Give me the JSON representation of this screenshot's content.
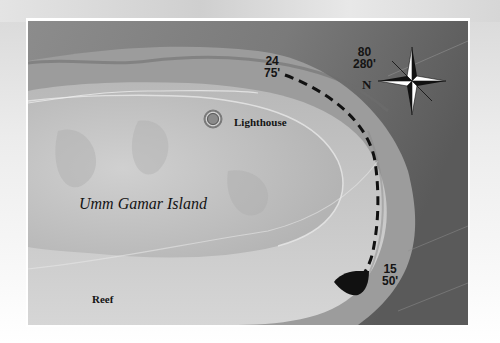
{
  "map": {
    "title": "Umm Gamar Island dive site map",
    "colors": {
      "deep_water": "#606060",
      "shallow_water": "#9a9a9a",
      "reef_flat": "#cfcfcf",
      "island": "#c2c2c2",
      "route_line": "#111111",
      "boat": "#111111",
      "frame": "#ffffff"
    },
    "labels": {
      "island": "Umm Gamar Island",
      "lighthouse": "Lighthouse",
      "reef": "Reef",
      "north": "N"
    },
    "compass": {
      "icon": "compass-rose-icon",
      "bearing_degrees": "80",
      "bearing_feet": "280'"
    },
    "route": {
      "style": "dashed",
      "points": [
        {
          "id": "start",
          "depth_m": "15",
          "depth_ft": "50'"
        },
        {
          "id": "end",
          "depth_m": "24",
          "depth_ft": "75'"
        }
      ]
    },
    "markers": [
      {
        "name": "lighthouse",
        "icon": "lighthouse-marker-icon"
      },
      {
        "name": "boat",
        "icon": "boat-icon"
      }
    ]
  }
}
